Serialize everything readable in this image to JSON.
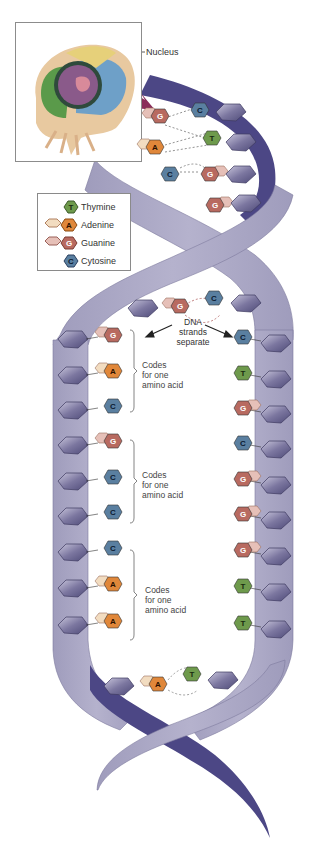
{
  "figure": {
    "inset_label": "Nucleus",
    "arrow_label": [
      "DNA",
      "strands",
      "separate"
    ],
    "codon_label": [
      "Codes",
      "for one",
      "amino acid"
    ]
  },
  "legend": {
    "items": [
      {
        "letter": "T",
        "name": "Thymine",
        "color": "#6e9a4c"
      },
      {
        "letter": "A",
        "name": "Adenine",
        "color": "#e0873a"
      },
      {
        "letter": "G",
        "name": "Guanine",
        "color": "#b86a60"
      },
      {
        "letter": "C",
        "name": "Cytosine",
        "color": "#5a7fa0"
      }
    ]
  },
  "colors": {
    "backbone_light": "#a9a6c4",
    "backbone_dark": "#4c4785",
    "sugar": "#7e7a9e",
    "thymine": "#6e9a4c",
    "adenine": "#e0873a",
    "guanine": "#b86a60",
    "cytosine": "#5a7fa0"
  },
  "top_pairs": [
    {
      "left": "G",
      "right": "C"
    },
    {
      "left": "A",
      "right": "T"
    },
    {
      "left": "C",
      "right": "G"
    },
    {
      "left": "",
      "right": "G"
    }
  ],
  "separation_pair": {
    "left": "G",
    "right": "C"
  },
  "left_strand": [
    "G",
    "A",
    "C",
    "G",
    "C",
    "C",
    "C",
    "A",
    "A"
  ],
  "right_strand": [
    "C",
    "T",
    "G",
    "C",
    "G",
    "G",
    "G",
    "T",
    "T"
  ],
  "bottom_pair": {
    "left": "A",
    "right": "T"
  },
  "codons": [
    {
      "bases": [
        "G",
        "A",
        "C"
      ],
      "label": "Codes for one amino acid"
    },
    {
      "bases": [
        "G",
        "C",
        "C"
      ],
      "label": "Codes for one amino acid"
    },
    {
      "bases": [
        "C",
        "A",
        "A"
      ],
      "label": "Codes for one amino acid"
    }
  ]
}
